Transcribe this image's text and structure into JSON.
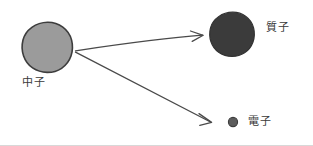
{
  "diagram": {
    "background_color": "#ffffff",
    "nodes": [
      {
        "id": "neutron",
        "label": "中子",
        "shape": "circle",
        "fill_color": "#9a9a9a",
        "stroke_color": "#3d3d3d",
        "cx": 47,
        "cy": 47,
        "r": 25
      },
      {
        "id": "proton",
        "label": "質子",
        "shape": "circle",
        "fill_color": "#3d3d3d",
        "stroke_color": "#3d3d3d",
        "cx": 232,
        "cy": 34,
        "r": 22
      },
      {
        "id": "electron",
        "label": "電子",
        "shape": "circle",
        "fill_color": "#5a5a5a",
        "stroke_color": "#3d3d3d",
        "cx": 233,
        "cy": 122,
        "r": 4.5
      }
    ],
    "arrows": [
      {
        "id": "neutron-to-proton",
        "from": "neutron",
        "to": "proton",
        "stroke_color": "#4a4a4a",
        "label": ""
      },
      {
        "id": "neutron-to-electron",
        "from": "neutron",
        "to": "electron",
        "stroke_color": "#4a4a4a",
        "label": ""
      }
    ]
  }
}
